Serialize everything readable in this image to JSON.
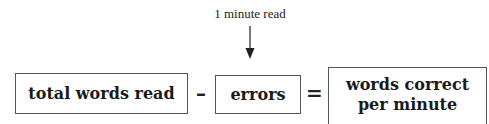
{
  "diagram": {
    "top_label": "1 minute read",
    "arrow": "down-arrow",
    "boxes": [
      {
        "text": "total words read"
      },
      {
        "text": "errors"
      },
      {
        "text": "words correct per minute"
      }
    ],
    "operators": {
      "minus": "–",
      "equals": "="
    },
    "colors": {
      "border": "#555555",
      "text": "#1a1a1a",
      "background": "#ffffff"
    }
  }
}
